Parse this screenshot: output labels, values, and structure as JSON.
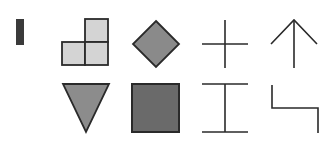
{
  "figure": {
    "width": 331,
    "height": 148,
    "background": "#ffffff",
    "stroke_color": "#2a2a2a",
    "shapes": {
      "bar": {
        "x": 16,
        "y": 19,
        "w": 8,
        "h": 26,
        "fill": "#3a3a3a"
      },
      "l_tromino": {
        "cell": 23,
        "cells": [
          {
            "x": 85,
            "y": 19
          },
          {
            "x": 62,
            "y": 42
          },
          {
            "x": 85,
            "y": 42
          }
        ],
        "fill": "#d4d4d4"
      },
      "diamond": {
        "cx": 156,
        "cy": 44,
        "r": 23,
        "fill": "#8a8a8a"
      },
      "plus": {
        "cx": 225,
        "cy": 44,
        "half_w": 23,
        "top": 20,
        "bottom": 68
      },
      "arrow_up": {
        "apex_x": 294,
        "apex_y": 20,
        "bottom_y": 68,
        "arm_dx": 23,
        "arm_y": 44
      },
      "triangle_down": {
        "x1": 63,
        "x2": 109,
        "top_y": 84,
        "apex_x": 86,
        "apex_y": 132,
        "fill": "#8c8c8c"
      },
      "square": {
        "x": 132,
        "y": 84,
        "w": 47,
        "h": 48,
        "fill": "#6a6a6a"
      },
      "i_beam": {
        "cx": 225,
        "left": 202,
        "right": 248,
        "top": 84,
        "bottom": 132
      },
      "step": {
        "x1": 272,
        "y1": 85,
        "ymid": 108,
        "x2": 318,
        "y2": 133
      }
    }
  }
}
